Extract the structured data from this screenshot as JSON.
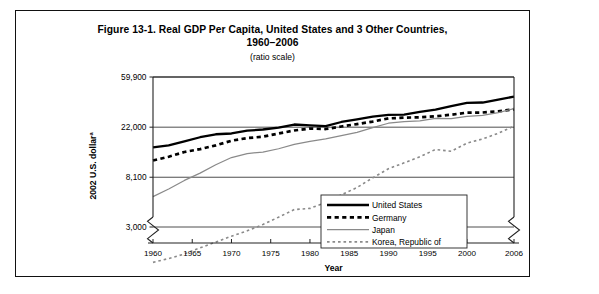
{
  "figure": {
    "title_line1": "Figure 13-1. Real GDP Per Capita, United States and 3 Other Countries,",
    "title_line2": "1960–2006",
    "subtitle": "(ratio scale)"
  },
  "chart_data": {
    "type": "line",
    "title": "Figure 13-1. Real GDP Per Capita, United States and 3 Other Countries, 1960–2006",
    "subtitle": "(ratio scale)",
    "xlabel": "Year",
    "ylabel": "2002 U.S. dollar",
    "ylabel_superscript": "a",
    "yscale": "log",
    "ylim": [
      1300,
      59900
    ],
    "xlim": [
      1960,
      2006
    ],
    "ytick_labels": [
      "59,900",
      "22,000",
      "8,100",
      "3,000"
    ],
    "ytick_values": [
      59900,
      22000,
      8100,
      3000
    ],
    "xtick_labels": [
      "1960",
      "1965",
      "1970",
      "1975",
      "1980",
      "1985",
      "1990",
      "1995",
      "2000",
      "2006"
    ],
    "xtick_values": [
      1960,
      1965,
      1970,
      1975,
      1980,
      1985,
      1990,
      1995,
      2000,
      2006
    ],
    "grid": true,
    "axis_break": true,
    "legend_position": "lower-right",
    "x": [
      1960,
      1962,
      1964,
      1966,
      1968,
      1970,
      1972,
      1974,
      1976,
      1978,
      1980,
      1982,
      1984,
      1986,
      1988,
      1990,
      1992,
      1994,
      1996,
      1998,
      2000,
      2002,
      2004,
      2006
    ],
    "series": [
      {
        "name": "United States",
        "style": "thick-solid",
        "color": "#000000",
        "values": [
          14700,
          15300,
          16600,
          18000,
          19100,
          19400,
          20500,
          21000,
          21800,
          23200,
          22800,
          22500,
          24400,
          25700,
          27200,
          28100,
          28300,
          29800,
          31200,
          33500,
          35700,
          36000,
          38200,
          40500
        ]
      },
      {
        "name": "Germany",
        "style": "thick-dashed",
        "color": "#000000",
        "values": [
          11300,
          12200,
          13400,
          14200,
          15300,
          16800,
          17700,
          18200,
          19400,
          20600,
          21400,
          21200,
          22300,
          23400,
          24600,
          26200,
          26600,
          26800,
          27300,
          28200,
          29400,
          29500,
          30200,
          31500
        ]
      },
      {
        "name": "Japan",
        "style": "thin-solid",
        "color": "#8a8a8a",
        "values": [
          5500,
          6400,
          7600,
          8800,
          10400,
          12000,
          13000,
          13400,
          14300,
          15600,
          16600,
          17400,
          18600,
          19800,
          21800,
          23800,
          24600,
          24900,
          26200,
          26100,
          27300,
          27800,
          29400,
          31900
        ]
      },
      {
        "name": "Korea, Republic of",
        "style": "thin-dashed",
        "color": "#8a8a8a",
        "values": [
          1480,
          1600,
          1750,
          1980,
          2220,
          2500,
          2780,
          3150,
          3650,
          4250,
          4350,
          4900,
          5700,
          6600,
          8000,
          9600,
          10800,
          12200,
          14100,
          13600,
          16000,
          17400,
          19500,
          22500
        ]
      }
    ]
  },
  "legend": {
    "items": [
      {
        "label": "United States"
      },
      {
        "label": "Germany"
      },
      {
        "label": "Japan"
      },
      {
        "label": "Korea, Republic of"
      }
    ]
  },
  "axes": {
    "x_axis_title": "Year",
    "y_axis_title": "2002 U.S. dollar",
    "y_axis_title_superscript": "a"
  }
}
